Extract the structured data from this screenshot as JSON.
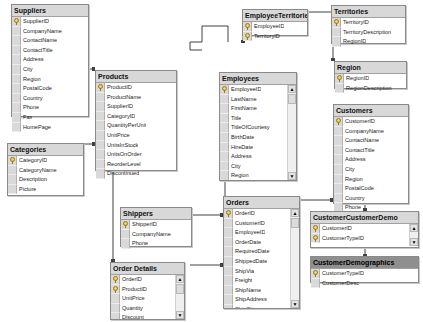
{
  "diagram": {
    "tables": {
      "suppliers": {
        "name": "Suppliers",
        "columns": [
          "SupplierID",
          "CompanyName",
          "ContactName",
          "ContactTitle",
          "Address",
          "City",
          "Region",
          "PostalCode",
          "Country",
          "Phone",
          "Fax",
          "HomePage"
        ],
        "keys": [
          "SupplierID"
        ]
      },
      "products": {
        "name": "Products",
        "columns": [
          "ProductID",
          "ProductName",
          "SupplierID",
          "CategoryID",
          "QuantityPerUnit",
          "UnitPrice",
          "UnitsInStock",
          "UnitsOnOrder",
          "ReorderLevel",
          "Discontinued"
        ],
        "keys": [
          "ProductID"
        ]
      },
      "categories": {
        "name": "Categories",
        "columns": [
          "CategoryID",
          "CategoryName",
          "Description",
          "Picture"
        ],
        "keys": [
          "CategoryID"
        ]
      },
      "employee_territories": {
        "name": "EmployeeTerritories",
        "columns": [
          "EmployeeID",
          "TerritoryID"
        ],
        "keys": [
          "EmployeeID",
          "TerritoryID"
        ]
      },
      "territories": {
        "name": "Territories",
        "columns": [
          "TerritoryID",
          "TerritoryDescription",
          "RegionID"
        ],
        "keys": [
          "TerritoryID"
        ]
      },
      "region": {
        "name": "Region",
        "columns": [
          "RegionID",
          "RegionDescription"
        ],
        "keys": [
          "RegionID"
        ]
      },
      "employees": {
        "name": "Employees",
        "columns": [
          "EmployeeID",
          "LastName",
          "FirstName",
          "Title",
          "TitleOfCourtesy",
          "BirthDate",
          "HireDate",
          "Address",
          "City",
          "Region",
          "PostalCode",
          "Country"
        ],
        "keys": [
          "EmployeeID"
        ],
        "scrollable": true
      },
      "customers": {
        "name": "Customers",
        "columns": [
          "CustomerID",
          "CompanyName",
          "ContactName",
          "ContactTitle",
          "Address",
          "City",
          "Region",
          "PostalCode",
          "Country",
          "Phone",
          "Fax"
        ],
        "keys": [
          "CustomerID"
        ]
      },
      "shippers": {
        "name": "Shippers",
        "columns": [
          "ShipperID",
          "CompanyName",
          "Phone"
        ],
        "keys": [
          "ShipperID"
        ]
      },
      "orders": {
        "name": "Orders",
        "columns": [
          "OrderID",
          "CustomerID",
          "EmployeeID",
          "OrderDate",
          "RequiredDate",
          "ShippedDate",
          "ShipVia",
          "Freight",
          "ShipName",
          "ShipAddress",
          "ShipCity",
          "ShipRegion"
        ],
        "keys": [
          "OrderID"
        ],
        "scrollable": true
      },
      "order_details": {
        "name": "Order Details",
        "columns": [
          "OrderID",
          "ProductID",
          "UnitPrice",
          "Quantity",
          "Discount"
        ],
        "keys": [
          "OrderID",
          "ProductID"
        ],
        "scrollable": true
      },
      "customer_customer_demo": {
        "name": "CustomerCustomerDemo",
        "columns": [
          "CustomerID",
          "CustomerTypeID"
        ],
        "keys": [
          "CustomerID",
          "CustomerTypeID"
        ],
        "scrollable": true
      },
      "customer_demographics": {
        "name": "CustomerDemographics",
        "columns": [
          "CustomerTypeID",
          "CustomerDesc"
        ],
        "keys": [
          "CustomerTypeID"
        ],
        "selected": true
      }
    },
    "colors": {
      "header": "#d8d8d8",
      "header_selected": "#8f8f8f",
      "gutter": "#d9d9d9",
      "border": "#8a8a8a",
      "line": "#404040"
    }
  }
}
